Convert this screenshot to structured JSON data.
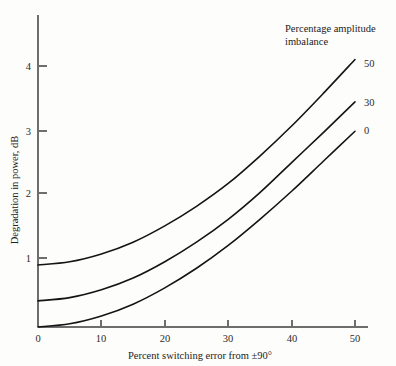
{
  "figure": {
    "background_color": "#fdfdfb",
    "ink_color": "#141414",
    "axis_color": "#6e6e6e"
  },
  "axes": {
    "x_title": "Percent switching error from ±90°",
    "y_title": "Degradation in power, dB",
    "x_ticks": [
      "0",
      "10",
      "20",
      "30",
      "40",
      "50"
    ],
    "y_ticks": [
      "1",
      "2",
      "3",
      "4"
    ]
  },
  "legend": {
    "title_line1": "Percentage amplitude",
    "title_line2": "imbalance",
    "entries": [
      "50",
      "30",
      "0"
    ]
  },
  "chart_data": {
    "type": "line",
    "title": "",
    "subtitle": "",
    "xlabel": "Percent switching error from ±90°",
    "ylabel": "Degradation in power, dB",
    "xlim": [
      0,
      52
    ],
    "ylim": [
      0,
      4.6
    ],
    "xticks": [
      0,
      10,
      20,
      30,
      40,
      50
    ],
    "yticks": [
      1,
      2,
      3,
      4
    ],
    "grid": false,
    "legend_position": "top-right-annotation",
    "legend_title": "Percentage amplitude imbalance",
    "annotations": [
      {
        "text": "50",
        "x": 50,
        "y": 4.1
      },
      {
        "text": "30",
        "x": 50,
        "y": 3.45
      },
      {
        "text": "0",
        "x": 50,
        "y": 3.0
      }
    ],
    "x": [
      0,
      5,
      10,
      15,
      20,
      25,
      30,
      35,
      40,
      45,
      50
    ],
    "series": [
      {
        "name": "50",
        "label": "50",
        "values": [
          0.95,
          1.0,
          1.12,
          1.3,
          1.55,
          1.85,
          2.2,
          2.62,
          3.08,
          3.58,
          4.1
        ]
      },
      {
        "name": "30",
        "label": "30",
        "values": [
          0.4,
          0.45,
          0.57,
          0.75,
          1.0,
          1.3,
          1.65,
          2.06,
          2.52,
          2.98,
          3.45
        ]
      },
      {
        "name": "0",
        "label": "0",
        "values": [
          0.0,
          0.05,
          0.17,
          0.35,
          0.6,
          0.9,
          1.25,
          1.65,
          2.08,
          2.54,
          3.0
        ]
      }
    ]
  }
}
